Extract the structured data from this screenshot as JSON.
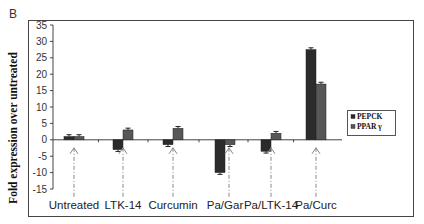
{
  "panel_label": "B",
  "chart_data": {
    "type": "bar",
    "title": "",
    "xlabel": "",
    "ylabel": "Fold expression over untreated",
    "ylim": [
      -15,
      35
    ],
    "yticks": [
      35,
      30,
      25,
      20,
      15,
      10,
      5,
      0,
      -5,
      -10,
      -15
    ],
    "grid": false,
    "legend_position": "right",
    "categories": [
      "Untreated",
      "LTK-14",
      "Curcumin",
      "Pa/Gar",
      "Pa/LTK-14",
      "Pa/Curc"
    ],
    "series": [
      {
        "name": "PEPCK",
        "color": "#2b2b2b",
        "values": [
          1,
          -3,
          -1.5,
          -10,
          -3.5,
          27.5
        ]
      },
      {
        "name": "PPAR γ",
        "color": "#575757",
        "values": [
          1,
          3,
          3.5,
          -1.5,
          2,
          17
        ]
      }
    ],
    "annotations": "Dashed vertical arrows point up from each category label to its bar pair; error bars on each bar"
  }
}
